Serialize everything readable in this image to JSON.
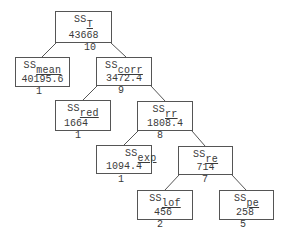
{
  "diagram": {
    "type": "ANOVA sum of squares decomposition tree",
    "nodes": [
      {
        "id": "T",
        "label": "SS",
        "subscript": "T",
        "value": "43668",
        "df": "10"
      },
      {
        "id": "mean",
        "label": "SS",
        "subscript": "mean",
        "value": "40195.6",
        "df": "1"
      },
      {
        "id": "corr",
        "label": "SS",
        "subscript": "corr",
        "value": "3472.4",
        "df": "9"
      },
      {
        "id": "red",
        "label": "SS",
        "subscript": "red",
        "value": "1664",
        "df": "1"
      },
      {
        "id": "rr",
        "label": "SS",
        "subscript": "rr",
        "value": "1808.4",
        "df": "8"
      },
      {
        "id": "exp",
        "label": "SS",
        "subscript": "exp",
        "value": "1094.4",
        "df": "1"
      },
      {
        "id": "re",
        "label": "SS",
        "subscript": "re",
        "value": "714",
        "df": "7"
      },
      {
        "id": "lof",
        "label": "SS",
        "subscript": "lof",
        "value": "456",
        "df": "2"
      },
      {
        "id": "pe",
        "label": "SS",
        "subscript": "pe",
        "value": "258",
        "df": "5"
      }
    ],
    "edges": [
      [
        "T",
        "mean"
      ],
      [
        "T",
        "corr"
      ],
      [
        "corr",
        "red"
      ],
      [
        "corr",
        "rr"
      ],
      [
        "rr",
        "exp"
      ],
      [
        "rr",
        "re"
      ],
      [
        "re",
        "lof"
      ],
      [
        "re",
        "pe"
      ]
    ]
  }
}
